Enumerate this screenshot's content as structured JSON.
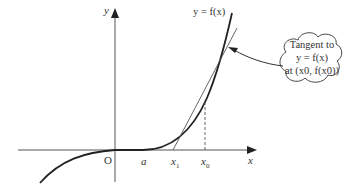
{
  "diagram": {
    "axes": {
      "x_label": "x",
      "y_label": "y",
      "origin_label": "O"
    },
    "tick_labels": {
      "a": "a",
      "x1": "x",
      "x1_sub": "1",
      "x0": "x",
      "x0_sub": "0"
    },
    "curve_label": "y = f(x)",
    "callout": {
      "line1": "Tangent to",
      "line2": "y = f(x)",
      "line3": "at (x0, f(x0))"
    },
    "colors": {
      "stroke": "#333333",
      "curve": "#222222",
      "background": "#ffffff"
    }
  }
}
